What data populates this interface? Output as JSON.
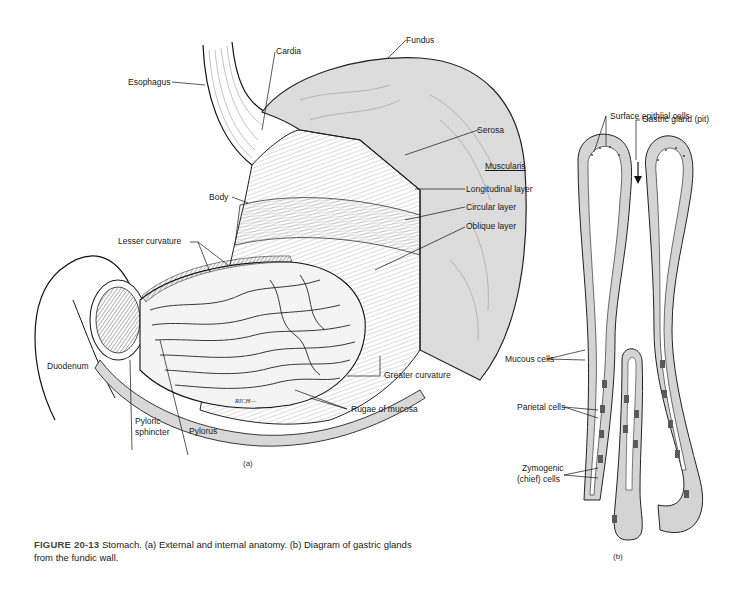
{
  "figure": {
    "number": "FIGURE 20-13",
    "caption_text": "Stomach. (a) External and internal anatomy. (b) Diagram of gastric glands",
    "caption_text_line2": "from the fundic wall.",
    "colors": {
      "ink": "#1a1a1a",
      "serosa_fill": "#d9d9d9",
      "cell_fill": "#d0d0d0",
      "parietal_fill": "#5a5a5a",
      "background": "#ffffff"
    }
  },
  "panel_a": {
    "tag": "(a)",
    "artist_signature": "RICH",
    "labels": {
      "cardia": "Cardia",
      "fundus": "Fundus",
      "esophagus": "Esophagus",
      "serosa": "Serosa",
      "muscularis": "Muscularis",
      "longitudinal_layer": "Longitudinal layer",
      "body": "Body",
      "circular_layer": "Circular layer",
      "oblique_layer": "Oblique layer",
      "lesser_curvature": "Lesser curvature",
      "duodenum": "Duodenum",
      "greater_curvature": "Greater curvature",
      "rugae_of_mucosa": "Rugae of mucosa",
      "pyloric_sphincter_line1": "Pyloric",
      "pyloric_sphincter_line2": "sphincter",
      "pylorus": "Pylorus"
    }
  },
  "panel_b": {
    "tag": "(b)",
    "labels": {
      "surface_epithelial_cells": "Surface epithlial cells",
      "gastric_gland_pit": "Gastric gland (pit)",
      "mucous_cells": "Mucous cells",
      "parietal_cells": "Parietal cells",
      "zymogenic_line1": "Zymogenic",
      "zymogenic_line2": "(chief) cells"
    }
  }
}
